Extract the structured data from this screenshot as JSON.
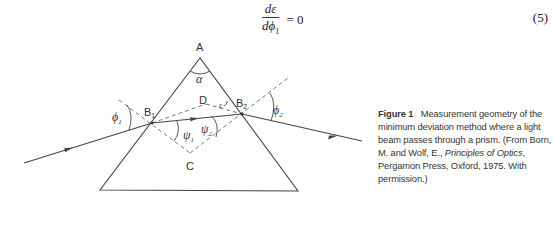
{
  "equation": {
    "numerator": "dε",
    "denominator": "dϕ",
    "denominator_subscript": "1",
    "rhs": "= 0",
    "number": "(5)"
  },
  "diagram": {
    "labels": {
      "apex": "A",
      "apex_angle": "α",
      "entry_point": "B",
      "entry_point_sub": "1",
      "exit_point": "B",
      "exit_point_sub": "2",
      "upper_intersection": "D",
      "lower_intersection": "C",
      "deviation_angle": "ε",
      "incidence_angle": "ϕ",
      "incidence_angle_sub": "1",
      "emergence_angle": "ϕ",
      "emergence_angle_sub": "2",
      "refraction_angle_1": "ψ",
      "refraction_angle_1_sub": "1",
      "refraction_angle_2": "ψ",
      "refraction_angle_2_sub": "2"
    },
    "colors": {
      "line": "#444444",
      "dashed": "#666666"
    }
  },
  "caption": {
    "figure_label": "Figure 1",
    "text_1": "Measurement geometry of the minimum deviation method where a light beam passes through a prism. (From Born, M. and Wolf, E., ",
    "book_title": "Principles of Optics",
    "text_2": ", Pergamon Press, Oxford, 1975. With permission.)"
  }
}
